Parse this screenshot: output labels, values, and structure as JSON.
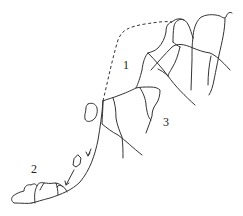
{
  "diagram": {
    "type": "rockfall-slope-schematic",
    "labels": [
      {
        "id": "1",
        "text": "1",
        "x": 123,
        "y": 59
      },
      {
        "id": "3",
        "text": "3",
        "x": 163,
        "y": 116
      },
      {
        "id": "2",
        "text": "2",
        "x": 31,
        "y": 163
      }
    ],
    "colors": {
      "stroke": "#333333",
      "background": "#ffffff"
    }
  }
}
